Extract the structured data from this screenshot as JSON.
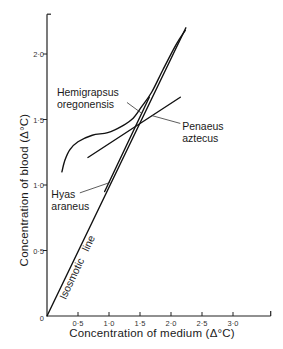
{
  "chart_data": {
    "type": "line",
    "title": "",
    "xlabel": "Concentration of medium (Δ°C)",
    "ylabel": "Concentration of blood (Δ°C)",
    "xlim": [
      0,
      3.6
    ],
    "ylim": [
      0,
      2.3
    ],
    "grid": false,
    "legend": null,
    "x_ticks": [
      0.5,
      1.0,
      1.5,
      2.0,
      2.5,
      3.0
    ],
    "x_tick_labels": [
      "0·5",
      "1·0",
      "1·5",
      "2·0",
      "2·5",
      "3·0"
    ],
    "y_ticks": [
      0,
      0.5,
      1.0,
      1.5,
      2.0
    ],
    "y_tick_labels": [
      "0",
      "0·5",
      "1·0",
      "1·5",
      "2·0"
    ],
    "series": [
      {
        "name": "Isosmotic line",
        "style": "straight",
        "points": [
          [
            0,
            0
          ],
          [
            2.24,
            2.2
          ]
        ]
      },
      {
        "name": "Hemigrapsus oregonensis",
        "style": "smooth",
        "points": [
          [
            0.24,
            1.1
          ],
          [
            0.29,
            1.19
          ],
          [
            0.37,
            1.27
          ],
          [
            0.5,
            1.33
          ],
          [
            0.73,
            1.38
          ],
          [
            0.98,
            1.4
          ],
          [
            1.21,
            1.45
          ],
          [
            1.39,
            1.51
          ],
          [
            1.53,
            1.6
          ],
          [
            1.69,
            1.71
          ],
          [
            1.87,
            1.88
          ],
          [
            2.08,
            2.07
          ],
          [
            2.23,
            2.18
          ]
        ]
      },
      {
        "name": "Penaeus aztecus",
        "style": "straight",
        "points": [
          [
            0.66,
            1.21
          ],
          [
            2.15,
            1.67
          ]
        ]
      },
      {
        "name": "Hyas araneus",
        "style": "straight",
        "points": [
          [
            0.93,
            0.95
          ],
          [
            1.65,
            1.67
          ]
        ]
      }
    ],
    "annotations": [
      {
        "id": "hemigrapsus",
        "lines": [
          "Hemigrapsus",
          "oregonensis"
        ],
        "at": [
          0.16,
          1.68
        ],
        "pointer": [
          [
            1.29,
            1.63
          ],
          [
            1.52,
            1.55
          ]
        ]
      },
      {
        "id": "penaeus",
        "lines": [
          "Penaeus",
          "aztecus"
        ],
        "at": [
          2.18,
          1.42
        ],
        "pointer": [
          [
            2.15,
            1.47
          ],
          [
            1.69,
            1.53
          ]
        ]
      },
      {
        "id": "hyas",
        "lines": [
          "Hyas",
          "araneus"
        ],
        "at": [
          0.07,
          0.9
        ],
        "pointer": [
          [
            0.53,
            0.94
          ],
          [
            1.02,
            1.02
          ]
        ]
      },
      {
        "id": "isosmotic",
        "lines": [
          "Isosmotic   line"
        ],
        "at": [
          0.54,
          0.36
        ],
        "rotate": -64.7
      }
    ]
  }
}
